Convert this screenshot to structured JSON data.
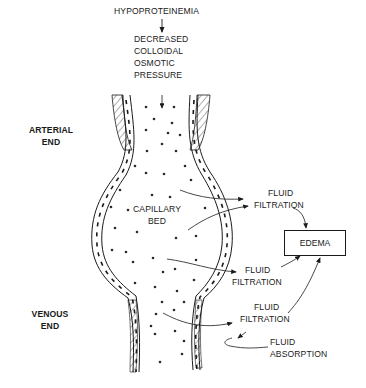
{
  "diagram": {
    "cause": "HYPOPROTEINEMIA",
    "effect_lines": [
      "DECREASED",
      "COLLOIDAL",
      "OSMOTIC",
      "PRESSURE"
    ],
    "side_labels": {
      "arterial": [
        "ARTERIAL",
        "END"
      ],
      "venous": [
        "VENOUS",
        "END"
      ]
    },
    "center_label": [
      "CAPILLARY",
      "BED"
    ],
    "flow_labels": [
      {
        "id": "filtration-1",
        "lines": [
          "FLUID",
          "FILTRATION"
        ]
      },
      {
        "id": "filtration-2",
        "lines": [
          "FLUID",
          "FILTRATION"
        ]
      },
      {
        "id": "filtration-3",
        "lines": [
          "FLUID",
          "FILTRATION"
        ]
      },
      {
        "id": "absorption",
        "lines": [
          "FLUID",
          "ABSORPTION"
        ]
      }
    ],
    "result_box": "EDEMA",
    "colors": {
      "ink": "#1a1a1a",
      "background": "#ffffff"
    }
  }
}
